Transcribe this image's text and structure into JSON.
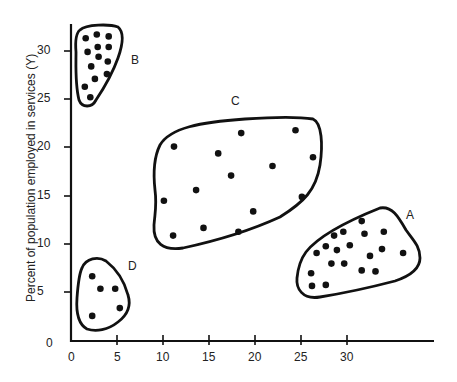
{
  "chart_data": {
    "type": "scatter",
    "title": "",
    "xlabel": "",
    "ylabel": "Percent of population employed in services (Y)",
    "x_ticks": [
      "0",
      "5",
      "10",
      "15",
      "20",
      "25",
      "30"
    ],
    "y_ticks": [
      "0",
      "5",
      "10",
      "15",
      "20",
      "25",
      "30"
    ],
    "xlim": [
      0,
      39
    ],
    "ylim": [
      0,
      33
    ],
    "grid": false,
    "legend": null,
    "series": [
      {
        "name": "A",
        "points": [
          [
            31.6,
            12.4
          ],
          [
            28.6,
            10.9
          ],
          [
            29.6,
            11.3
          ],
          [
            31.9,
            11.1
          ],
          [
            34.0,
            11.3
          ],
          [
            27.7,
            9.8
          ],
          [
            30.3,
            9.9
          ],
          [
            28.9,
            9.4
          ],
          [
            26.7,
            9.1
          ],
          [
            33.8,
            9.5
          ],
          [
            36.1,
            9.1
          ],
          [
            32.5,
            8.8
          ],
          [
            28.3,
            8.0
          ],
          [
            29.7,
            8.0
          ],
          [
            26.1,
            7.0
          ],
          [
            31.6,
            7.3
          ],
          [
            33.1,
            7.2
          ],
          [
            26.2,
            5.7
          ],
          [
            27.7,
            5.8
          ]
        ]
      },
      {
        "name": "B",
        "points": [
          [
            1.6,
            31.3
          ],
          [
            2.8,
            31.7
          ],
          [
            4.1,
            31.5
          ],
          [
            1.8,
            29.9
          ],
          [
            2.9,
            30.4
          ],
          [
            4.1,
            30.4
          ],
          [
            3.0,
            29.4
          ],
          [
            4.0,
            28.9
          ],
          [
            2.2,
            28.4
          ],
          [
            3.9,
            27.6
          ],
          [
            2.6,
            27.1
          ],
          [
            1.5,
            26.3
          ],
          [
            2.1,
            25.2
          ]
        ]
      },
      {
        "name": "C",
        "points": [
          [
            11.2,
            20.1
          ],
          [
            18.5,
            21.5
          ],
          [
            24.4,
            21.8
          ],
          [
            16.0,
            19.4
          ],
          [
            26.3,
            19.0
          ],
          [
            21.9,
            18.1
          ],
          [
            17.4,
            17.1
          ],
          [
            13.6,
            15.6
          ],
          [
            10.1,
            14.5
          ],
          [
            25.1,
            14.9
          ],
          [
            19.8,
            13.4
          ],
          [
            14.4,
            11.7
          ],
          [
            18.2,
            11.3
          ],
          [
            11.1,
            10.9
          ]
        ]
      },
      {
        "name": "D",
        "points": [
          [
            2.3,
            6.7
          ],
          [
            3.2,
            5.4
          ],
          [
            4.8,
            5.4
          ],
          [
            5.3,
            3.4
          ],
          [
            2.3,
            2.6
          ]
        ]
      }
    ]
  },
  "axes": {
    "ylabel": "Percent of population employed in services (Y)",
    "x_ticks": [
      {
        "label": "0",
        "px": 71
      },
      {
        "label": "5",
        "px": 117
      },
      {
        "label": "10",
        "px": 163
      },
      {
        "label": "15",
        "px": 209
      },
      {
        "label": "20",
        "px": 255
      },
      {
        "label": "25",
        "px": 301
      },
      {
        "label": "30",
        "px": 347
      }
    ],
    "y_ticks": [
      {
        "label": "0",
        "py": 341
      },
      {
        "label": "5",
        "py": 292
      },
      {
        "label": "10",
        "py": 244
      },
      {
        "label": "15",
        "py": 196
      },
      {
        "label": "20",
        "py": 147
      },
      {
        "label": "25",
        "py": 99
      },
      {
        "label": "30",
        "py": 51
      }
    ]
  },
  "clusters": {
    "A": {
      "label": "A"
    },
    "B": {
      "label": "B"
    },
    "C": {
      "label": "C"
    },
    "D": {
      "label": "D"
    }
  },
  "colors": {
    "ink": "#111111",
    "background": "#ffffff"
  }
}
